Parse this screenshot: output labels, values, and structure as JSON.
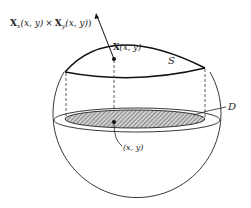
{
  "diagram": {
    "type": "surface-parametrization",
    "labels": {
      "normal_vector": "X_x(x, y) × X_y(x, y)",
      "normal_vector_bold": "X",
      "normal_sub_x": "x",
      "normal_sub_y": "y",
      "normal_args": "(x, y)",
      "times": "×",
      "surface_point": "X(x, y)",
      "surface_point_bold": "X",
      "surface_point_args": "(x, y)",
      "surface_name": "S",
      "domain_name": "D",
      "domain_point": "(x, y)"
    },
    "colors": {
      "stroke": "#222222",
      "hatch": "#555555",
      "background": "#ffffff"
    }
  }
}
